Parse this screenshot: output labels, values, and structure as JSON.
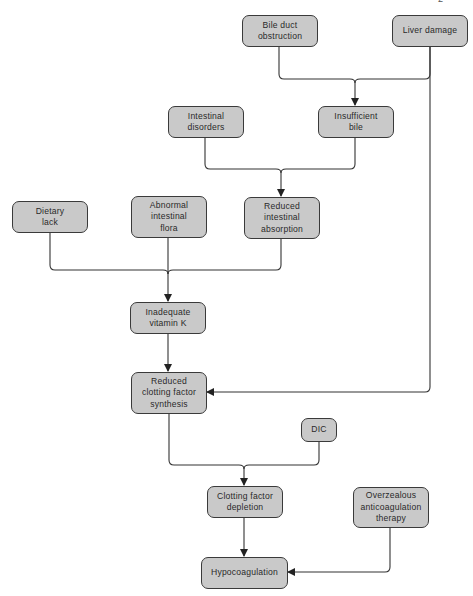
{
  "diagram": {
    "type": "flowchart",
    "corner_fragment": "2",
    "nodes": {
      "bile_duct": {
        "label": "Bile duct\nobstruction"
      },
      "liver_damage": {
        "label": "Liver damage"
      },
      "intestinal_disorders": {
        "label": "Intestinal\ndisorders"
      },
      "insufficient_bile": {
        "label": "Insufficient\nbile"
      },
      "dietary_lack": {
        "label": "Dietary\nlack"
      },
      "abnormal_flora": {
        "label": "Abnormal\nintestinal\nflora"
      },
      "reduced_absorption": {
        "label": "Reduced\nintestinal\nabsorption"
      },
      "inadequate_vitk": {
        "label": "Inadequate\nvitamin K"
      },
      "reduced_synthesis": {
        "label": "Reduced\nclotting factor\nsynthesis"
      },
      "dic": {
        "label": "DIC"
      },
      "factor_depletion": {
        "label": "Clotting factor\ndepletion"
      },
      "overzealous_therapy": {
        "label": "Overzealous\nanticoagulation\ntherapy"
      },
      "hypocoagulation": {
        "label": "Hypocoagulation"
      }
    },
    "edges": [
      {
        "from": [
          "bile_duct",
          "liver_damage"
        ],
        "to": "insufficient_bile"
      },
      {
        "from": [
          "intestinal_disorders",
          "insufficient_bile"
        ],
        "to": "reduced_absorption"
      },
      {
        "from": [
          "dietary_lack",
          "abnormal_flora",
          "reduced_absorption"
        ],
        "to": "inadequate_vitk"
      },
      {
        "from": [
          "inadequate_vitk"
        ],
        "to": "reduced_synthesis"
      },
      {
        "from": [
          "liver_damage"
        ],
        "to": "reduced_synthesis"
      },
      {
        "from": [
          "reduced_synthesis",
          "dic"
        ],
        "to": "factor_depletion"
      },
      {
        "from": [
          "factor_depletion"
        ],
        "to": "hypocoagulation"
      },
      {
        "from": [
          "overzealous_therapy"
        ],
        "to": "hypocoagulation"
      }
    ],
    "colors": {
      "node_fill": "#c9c9c9",
      "node_border": "#3a3a3a",
      "line": "#333333",
      "text": "#2a2a2a"
    }
  }
}
